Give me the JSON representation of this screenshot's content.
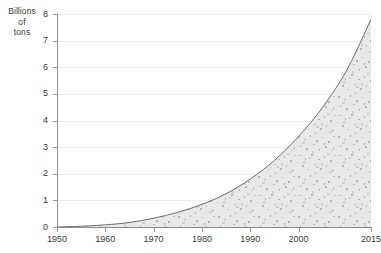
{
  "chart_data": {
    "type": "area",
    "title": "",
    "subtitle": "",
    "xlabel": "",
    "ylabel": "Billions of tons",
    "ylabel_lines": [
      "Billions",
      "of",
      "tons"
    ],
    "xlim": [
      1950,
      2015
    ],
    "ylim": [
      0,
      8
    ],
    "grid": true,
    "legend": false,
    "legend_position": "none",
    "y_ticks": [
      0,
      1,
      2,
      3,
      4,
      5,
      6,
      7,
      8
    ],
    "y_tick_labels": [
      "0",
      "1",
      "2",
      "3",
      "4",
      "5",
      "6",
      "7",
      "8"
    ],
    "x_ticks": [
      1950,
      1960,
      1970,
      1980,
      1990,
      2000,
      2015
    ],
    "x_tick_labels": [
      "1950",
      "1960",
      "1970",
      "1980",
      "1990",
      "2000",
      "2015"
    ],
    "series": [
      {
        "name": "Cumulative plastic production",
        "fill": "#d9d9d9",
        "line_color": "#6e6e6e",
        "x": [
          1950,
          1955,
          1960,
          1965,
          1970,
          1975,
          1980,
          1985,
          1990,
          1995,
          2000,
          2005,
          2010,
          2015
        ],
        "values": [
          0.0,
          0.03,
          0.08,
          0.17,
          0.33,
          0.55,
          0.85,
          1.25,
          1.8,
          2.5,
          3.4,
          4.5,
          5.9,
          7.8
        ]
      }
    ],
    "annotations": []
  },
  "caption": {
    "text": ""
  }
}
